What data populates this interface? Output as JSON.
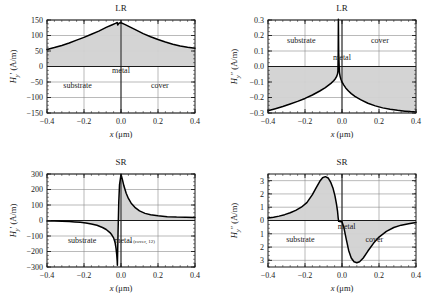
{
  "figure": {
    "name": "magnetic-field-profiles",
    "background": "#ffffff",
    "ink": "#1a1a1a",
    "grid_color": "#8c8c8c",
    "fill_color": "#d2d2d2",
    "curve_color": "#000000"
  },
  "panels": [
    {
      "id": "lr-hy-real",
      "title": "LR",
      "ylabel_main": "H",
      "ylabel_sub": "y",
      "ylabel_prime": "′",
      "ylabel_units": "(A/m)",
      "xlabel_main": "x",
      "xlabel_units": "(μm)",
      "xticks": [
        "−0.4",
        "−0.2",
        "0.0",
        "0.2",
        "0.4"
      ],
      "yticks": [
        "150",
        "100",
        "50",
        "0",
        "−50",
        "−100",
        "−150"
      ],
      "regions": [
        {
          "label": "metal",
          "x": 0.0,
          "y": -22
        },
        {
          "label": "substrate",
          "x": -0.235,
          "y": -68
        },
        {
          "label": "cover",
          "x": 0.21,
          "y": -68
        }
      ],
      "annotations": []
    },
    {
      "id": "lr-hy-imag",
      "title": "LR",
      "ylabel_main": "H",
      "ylabel_sub": "y",
      "ylabel_prime": "″",
      "ylabel_units": "(A/m)",
      "xlabel_main": "x",
      "xlabel_units": "(μm)",
      "xticks": [
        "−0.4",
        "−0.2",
        "0.0",
        "0.2",
        "0.4"
      ],
      "yticks": [
        "0.3",
        "0.2",
        "0.1",
        "0.0",
        "−0.1",
        "−0.2",
        "−0.3"
      ],
      "regions": [
        {
          "label": "substrate",
          "x": -0.22,
          "y": 0.152
        },
        {
          "label": "cover",
          "x": 0.205,
          "y": 0.152
        },
        {
          "label": "metal",
          "x": 0.0,
          "y": 0.043
        }
      ],
      "annotations": []
    },
    {
      "id": "sr-hy-real",
      "title": "SR",
      "ylabel_main": "H",
      "ylabel_sub": "y",
      "ylabel_prime": "′",
      "ylabel_units": "(A/m)",
      "xlabel_main": "x",
      "xlabel_units": "(μm)",
      "xticks": [
        "−0.4",
        "−0.2",
        "0.0",
        "0.2",
        "0.4"
      ],
      "yticks": [
        "300",
        "200",
        "100",
        "0",
        "−100",
        "−200",
        "−300"
      ],
      "regions": [
        {
          "label": "substrate",
          "x": -0.21,
          "y": -148
        },
        {
          "label": "metal",
          "x": 0.012,
          "y": -142
        }
      ],
      "annotations": [
        {
          "label": "c (cover, 12)",
          "x": 0.115,
          "y": -142
        }
      ]
    },
    {
      "id": "sr-hy-imag",
      "title": "SR",
      "ylabel_main": "H",
      "ylabel_sub": "y",
      "ylabel_prime": "″",
      "ylabel_units": "(A/m)",
      "xlabel_main": "x",
      "xlabel_units": "(μm)",
      "xticks": [
        "−0.4",
        "−0.2",
        "0.0",
        "0.2",
        "0.4"
      ],
      "yticks": [
        "3",
        "2",
        "1",
        "0",
        "1",
        "2",
        "3"
      ],
      "regions": [
        {
          "label": "metal",
          "x": 0.025,
          "y": -0.62
        },
        {
          "label": "substrate",
          "x": -0.225,
          "y": -1.62
        },
        {
          "label": "cover",
          "x": 0.175,
          "y": -1.62
        }
      ],
      "annotations": []
    }
  ],
  "chart_data": [
    {
      "type": "line",
      "id": "lr-hy-real",
      "title": "LR",
      "xlabel": "x (μm)",
      "ylabel": "H_y' (A/m)",
      "xlim": [
        -0.4,
        0.4
      ],
      "ylim": [
        -150,
        150
      ],
      "xticks": [
        -0.4,
        -0.2,
        0.0,
        0.2,
        0.4
      ],
      "yticks": [
        -150,
        -100,
        -50,
        0,
        50,
        100,
        150
      ],
      "grid": true,
      "legend": "none",
      "fill_to": 0,
      "x": [
        -0.4,
        -0.36,
        -0.32,
        -0.28,
        -0.24,
        -0.2,
        -0.16,
        -0.12,
        -0.08,
        -0.05,
        -0.03,
        -0.02,
        -0.018,
        -0.01,
        0.0,
        0.02,
        0.05,
        0.08,
        0.12,
        0.16,
        0.2,
        0.24,
        0.28,
        0.32,
        0.36,
        0.4
      ],
      "y": [
        55,
        61,
        68,
        76,
        85,
        94,
        104,
        114,
        126,
        134,
        139,
        142,
        134,
        140,
        141,
        136,
        127,
        118,
        106,
        96,
        87,
        79,
        72,
        66,
        62,
        59
      ]
    },
    {
      "type": "line",
      "id": "lr-hy-imag",
      "title": "LR",
      "xlabel": "x (μm)",
      "ylabel": "H_y'' (A/m)",
      "xlim": [
        -0.4,
        0.4
      ],
      "ylim": [
        -0.3,
        0.3
      ],
      "xticks": [
        -0.4,
        -0.2,
        0.0,
        0.2,
        0.4
      ],
      "yticks": [
        -0.3,
        -0.2,
        -0.1,
        0.0,
        0.1,
        0.2,
        0.3
      ],
      "grid": true,
      "legend": "none",
      "fill_to": 0,
      "x": [
        -0.4,
        -0.36,
        -0.32,
        -0.28,
        -0.24,
        -0.2,
        -0.16,
        -0.12,
        -0.09,
        -0.06,
        -0.045,
        -0.035,
        -0.028,
        -0.024,
        -0.022,
        -0.0205,
        -0.0195,
        -0.018,
        -0.014,
        -0.01,
        -0.006,
        0.0,
        0.01,
        0.02,
        0.035,
        0.05,
        0.07,
        0.1,
        0.14,
        0.18,
        0.22,
        0.26,
        0.3,
        0.34,
        0.37,
        0.4
      ],
      "y": [
        -0.285,
        -0.272,
        -0.258,
        -0.242,
        -0.225,
        -0.206,
        -0.184,
        -0.158,
        -0.136,
        -0.109,
        -0.092,
        -0.077,
        -0.062,
        -0.047,
        -0.028,
        0.09,
        0.305,
        0.09,
        -0.04,
        -0.065,
        -0.082,
        -0.1,
        -0.12,
        -0.138,
        -0.158,
        -0.175,
        -0.193,
        -0.214,
        -0.237,
        -0.254,
        -0.267,
        -0.276,
        -0.283,
        -0.288,
        -0.291,
        -0.293
      ]
    },
    {
      "type": "line",
      "id": "sr-hy-real",
      "title": "SR",
      "xlabel": "x (μm)",
      "ylabel": "H_y' (A/m)",
      "xlim": [
        -0.4,
        0.4
      ],
      "ylim": [
        -300,
        300
      ],
      "xticks": [
        -0.4,
        -0.2,
        0.0,
        0.2,
        0.4
      ],
      "yticks": [
        -300,
        -200,
        -100,
        0,
        100,
        200,
        300
      ],
      "grid": true,
      "legend": "none",
      "fill_to": 0,
      "x": [
        -0.4,
        -0.36,
        -0.32,
        -0.28,
        -0.25,
        -0.22,
        -0.19,
        -0.16,
        -0.13,
        -0.1,
        -0.08,
        -0.06,
        -0.05,
        -0.04,
        -0.032,
        -0.027,
        -0.023,
        -0.0205,
        -0.0195,
        -0.016,
        -0.012,
        -0.008,
        0.0,
        0.008,
        0.016,
        0.028,
        0.04,
        0.055,
        0.075,
        0.1,
        0.13,
        0.16,
        0.2,
        0.25,
        0.3,
        0.35,
        0.4
      ],
      "y": [
        -3,
        -4,
        -5,
        -7,
        -9,
        -12,
        -16,
        -22,
        -31,
        -45,
        -58,
        -78,
        -92,
        -112,
        -142,
        -178,
        -222,
        -262,
        -288,
        -80,
        120,
        230,
        298,
        262,
        222,
        176,
        142,
        112,
        85,
        62,
        46,
        37,
        30,
        25,
        22,
        21,
        20
      ]
    },
    {
      "type": "line",
      "id": "sr-hy-imag",
      "title": "SR",
      "xlabel": "x (μm)",
      "ylabel": "H_y'' (A/m)",
      "xlim": [
        -0.4,
        0.4
      ],
      "ylim": [
        -3.5,
        3.5
      ],
      "xticks": [
        -0.4,
        -0.2,
        0.0,
        0.2,
        0.4
      ],
      "yticks": [
        -3,
        -2,
        -1,
        0,
        1,
        2,
        3
      ],
      "grid": true,
      "legend": "none",
      "fill_to": 0,
      "x": [
        -0.4,
        -0.37,
        -0.34,
        -0.31,
        -0.28,
        -0.25,
        -0.22,
        -0.19,
        -0.16,
        -0.14,
        -0.12,
        -0.105,
        -0.09,
        -0.075,
        -0.06,
        -0.048,
        -0.038,
        -0.03,
        -0.024,
        -0.0205,
        -0.018,
        -0.012,
        -0.005,
        0.0,
        0.01,
        0.022,
        0.036,
        0.05,
        0.065,
        0.08,
        0.095,
        0.115,
        0.14,
        0.17,
        0.2,
        0.24,
        0.28,
        0.32,
        0.36,
        0.4
      ],
      "y": [
        0.18,
        0.25,
        0.33,
        0.44,
        0.58,
        0.76,
        1.0,
        1.35,
        1.95,
        2.45,
        2.95,
        3.22,
        3.3,
        3.2,
        2.85,
        2.4,
        1.85,
        1.25,
        0.68,
        0.18,
        -0.06,
        -0.08,
        -0.09,
        -0.1,
        -0.52,
        -1.35,
        -2.25,
        -2.82,
        -3.1,
        -3.18,
        -3.1,
        -2.82,
        -2.3,
        -1.72,
        -1.25,
        -0.82,
        -0.53,
        -0.35,
        -0.24,
        -0.15
      ]
    }
  ]
}
